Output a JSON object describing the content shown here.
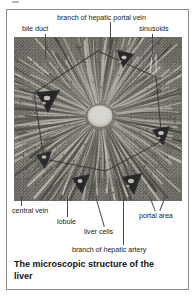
{
  "figure": {
    "caption": "The microscopic structure of the liver",
    "border_color": "#8d8d8d",
    "background": "#ffffff"
  },
  "micrograph": {
    "name": "liver-histology-micrograph",
    "description": "Grayscale light micrograph of a hepatic lobule showing a pale central vein with radiating cords of liver cells and sinusoids, bounded by a hexagonal outline with dark portal triads at its vertices.",
    "tone_dark": "#2c2c2c",
    "tone_mid": "#8d8d8d",
    "tone_light": "#e6e4de",
    "central_vein_fill": "#efeee8",
    "portal_triad_fill": "#16161a"
  },
  "labels": {
    "bile_duct": "bile duct",
    "branch_of_hepatic_portal_vein": "branch of hepatic portal vein",
    "sinusoids": "sinusoids",
    "central_vein": "central vein",
    "lobule": "lobule",
    "liver_cells": "liver cells",
    "branch_of_hepatic_artery": "branch of hepatic artery",
    "portal_area": "portal area"
  },
  "colors": {
    "leader_line": "#4a4a4a",
    "label_text": "#1c1c1c",
    "caption_text": "#111111"
  }
}
